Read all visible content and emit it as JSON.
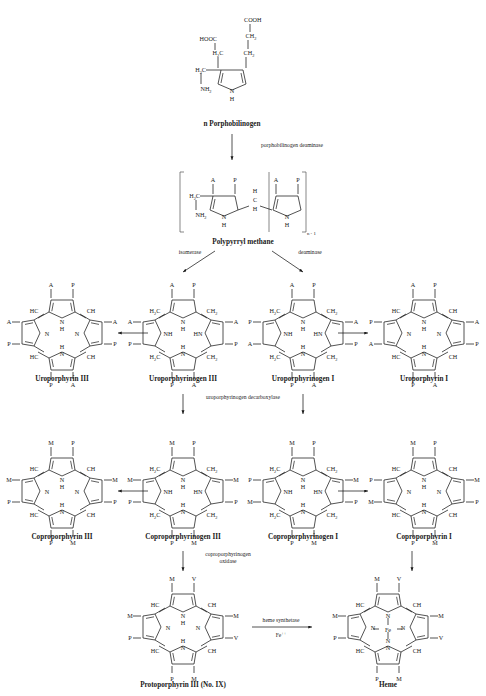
{
  "figure": {
    "background": "#ffffff",
    "ink": "#1a1a1a"
  },
  "substrate_top": {
    "name": "n  Porphobilinogen",
    "groups": [
      "COOH",
      "HOOC",
      "CH",
      "CH",
      "H",
      "C",
      "H",
      "C",
      "NH",
      "N",
      "H"
    ],
    "labels": {
      "cooh": "COOH",
      "hooc": "HOOC",
      "ch2_a": "CH",
      "ch2_b": "CH",
      "h2c_a": "H",
      "c_a": "C",
      "h2c_b": "H",
      "c_b": "C",
      "h2c_c": "H",
      "c_c": "C",
      "nh2": "NH",
      "n": "N",
      "h": "H",
      "sub2": "2",
      "sub3": "2"
    }
  },
  "enzymes": {
    "deaminase_top": "porphobilinogen deaminase",
    "isomerase": "isomerase",
    "deaminase": "deaminase",
    "decarboxylase": "uroporphyrinogen decarboxylase",
    "oxidase_line1": "coproporphyrinogen",
    "oxidase_line2": "oxidase",
    "synthetase_line1": "heme synthetase",
    "synthetase_line2": "Fe",
    "synthetase_charge": "++"
  },
  "intermediate": {
    "name": "Polypyrryl methane",
    "bracket_sub": "n - 1",
    "ring_left": {
      "top_left": "A",
      "top_right": "P",
      "n": "N",
      "h": "H",
      "h2c": "H",
      "c": "C",
      "nh2": "NH",
      "sub": "2"
    },
    "ring_right": {
      "top_left": "A",
      "top_right": "P",
      "n": "N",
      "h": "H",
      "hch": [
        "H",
        "C",
        "H"
      ]
    }
  },
  "rows": [
    {
      "row_id": "uroporphyrin-row",
      "structures": [
        {
          "id": "uroporphyrin-iii",
          "caption": "Uroporphyrin III",
          "kind": "porphyrin",
          "substituents": {
            "top_left": "A",
            "top_right": "P",
            "left_upper": "A",
            "left_lower": "P",
            "right_upper": "A",
            "right_lower": "P",
            "bottom_left": "P",
            "bottom_right": "A"
          },
          "bridges": [
            "HC",
            "CH",
            "HC",
            "CH"
          ],
          "inner": [
            "N",
            "H",
            "N",
            "N",
            "H",
            "N"
          ]
        },
        {
          "id": "uroporphyrinogen-iii",
          "caption": "Uroporphyrinogen III",
          "kind": "porphyrinogen",
          "substituents": {
            "top_left": "A",
            "top_right": "P",
            "left_upper": "A",
            "left_lower": "P",
            "right_upper": "A",
            "right_lower": "P",
            "bottom_left": "P",
            "bottom_right": "A"
          },
          "bridges": [
            "H2C",
            "CH2",
            "H2C",
            "CH2"
          ],
          "inner": [
            "N",
            "H",
            "NH",
            "HN",
            "N",
            "H"
          ]
        },
        {
          "id": "uroporphyrinogen-i",
          "caption": "Uroporphyrinogen I",
          "kind": "porphyrinogen",
          "substituents": {
            "top_left": "A",
            "top_right": "P",
            "left_upper": "P",
            "left_lower": "A",
            "right_upper": "A",
            "right_lower": "P",
            "bottom_left": "P",
            "bottom_right": "A"
          },
          "bridges": [
            "H2C",
            "CH2",
            "H2C",
            "CH2"
          ],
          "inner": [
            "N",
            "H",
            "NH",
            "HN",
            "N",
            "H"
          ]
        },
        {
          "id": "uroporphyrin-i",
          "caption": "Uroporphyrin I",
          "kind": "porphyrin",
          "substituents": {
            "top_left": "A",
            "top_right": "P",
            "left_upper": "P",
            "left_lower": "A",
            "right_upper": "A",
            "right_lower": "P",
            "bottom_left": "P",
            "bottom_right": "A"
          },
          "bridges": [
            "HC",
            "CH",
            "HC",
            "CH"
          ],
          "inner": [
            "N",
            "H",
            "N",
            "N",
            "H",
            "N"
          ]
        }
      ]
    },
    {
      "row_id": "coproporphyrin-row",
      "structures": [
        {
          "id": "coproporphyrin-iii",
          "caption": "Coproporphyrin III",
          "kind": "porphyrin",
          "substituents": {
            "top_left": "M",
            "top_right": "P",
            "left_upper": "M",
            "left_lower": "P",
            "right_upper": "M",
            "right_lower": "P",
            "bottom_left": "P",
            "bottom_right": "M"
          },
          "bridges": [
            "HC",
            "CH",
            "HC",
            "CH"
          ],
          "inner": [
            "N",
            "H",
            "N",
            "N",
            "H",
            "N"
          ]
        },
        {
          "id": "coproporphyrinogen-iii",
          "caption": "Coproporphyrinogen III",
          "kind": "porphyrinogen",
          "substituents": {
            "top_left": "M",
            "top_right": "P",
            "left_upper": "M",
            "left_lower": "P",
            "right_upper": "M",
            "right_lower": "P",
            "bottom_left": "P",
            "bottom_right": "M"
          },
          "bridges": [
            "H2C",
            "CH2",
            "H2C",
            "CH2"
          ],
          "inner": [
            "N",
            "H",
            "NH",
            "HN",
            "N",
            "H"
          ]
        },
        {
          "id": "coproporphyrinogen-i",
          "caption": "Coproporphyrinogen I",
          "kind": "porphyrinogen",
          "substituents": {
            "top_left": "M",
            "top_right": "P",
            "left_upper": "P",
            "left_lower": "M",
            "right_upper": "M",
            "right_lower": "P",
            "bottom_left": "P",
            "bottom_right": "M"
          },
          "bridges": [
            "H2C",
            "CH2",
            "H2C",
            "CH2"
          ],
          "inner": [
            "N",
            "H",
            "NH",
            "HN",
            "N",
            "H"
          ]
        },
        {
          "id": "coproporphyrin-i",
          "caption": "Coproporphyrin I",
          "kind": "porphyrin",
          "substituents": {
            "top_left": "M",
            "top_right": "P",
            "left_upper": "P",
            "left_lower": "M",
            "right_upper": "M",
            "right_lower": "P",
            "bottom_left": "P",
            "bottom_right": "M"
          },
          "bridges": [
            "HC",
            "CH",
            "HC",
            "CH"
          ],
          "inner": [
            "N",
            "H",
            "N",
            "N",
            "H",
            "N"
          ]
        }
      ]
    },
    {
      "row_id": "heme-row",
      "structures": [
        {
          "id": "protoporphyrin-iii",
          "caption": "Protoporphyrin III (No. IX)",
          "kind": "porphyrin",
          "substituents": {
            "top_left": "M",
            "top_right": "V",
            "left_upper": "M",
            "left_lower": "P",
            "right_upper": "M",
            "right_lower": "V",
            "bottom_left": "P",
            "bottom_right": "M"
          },
          "bridges": [
            "HC",
            "CH",
            "HC",
            "CH"
          ],
          "inner": [
            "N",
            "H",
            "N",
            "N",
            "H",
            "N"
          ]
        },
        {
          "id": "heme",
          "caption": "Heme",
          "kind": "metalloporphyrin",
          "metal": "Fe",
          "substituents": {
            "top_left": "M",
            "top_right": "V",
            "left_upper": "M",
            "left_lower": "P",
            "right_upper": "M",
            "right_lower": "V",
            "bottom_left": "P",
            "bottom_right": "M"
          },
          "bridges": [
            "HC",
            "CH",
            "HC",
            "CH"
          ],
          "inner": [
            "N",
            "N",
            "N",
            "N"
          ]
        }
      ]
    }
  ]
}
